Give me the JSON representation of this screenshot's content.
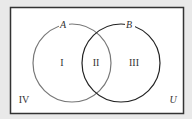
{
  "diagram": {
    "type": "venn",
    "universe_label": "U",
    "sets": [
      {
        "name": "A",
        "color": "#777777"
      },
      {
        "name": "B",
        "color": "#222222"
      }
    ],
    "regions": {
      "only_a": "I",
      "a_and_b": "II",
      "only_b": "III",
      "outside": "IV"
    },
    "colors": {
      "background": "#e9e9e9",
      "box_fill": "#ffffff",
      "box_stroke": "#333333"
    }
  }
}
